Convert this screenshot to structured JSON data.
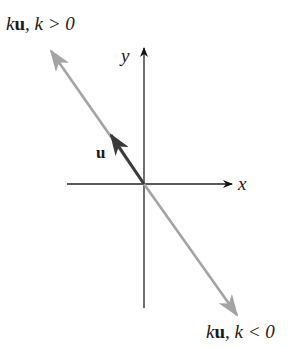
{
  "diagram": {
    "axes": {
      "x_label": "x",
      "y_label": "y",
      "origin": [
        144,
        184
      ]
    },
    "vectors": [
      {
        "name": "u",
        "label": "u",
        "color": "#3a3a3a",
        "from": [
          144,
          184
        ],
        "to": [
          111,
          135
        ]
      },
      {
        "name": "ku_positive",
        "label_k": "k",
        "label_u": "u",
        "label_cond": ", k > 0",
        "color": "#a3a3a3",
        "to": [
          51,
          51
        ]
      },
      {
        "name": "ku_negative",
        "label_k": "k",
        "label_u": "u",
        "label_cond": ", k < 0",
        "color": "#a3a3a3",
        "to": [
          237,
          315
        ]
      }
    ]
  }
}
